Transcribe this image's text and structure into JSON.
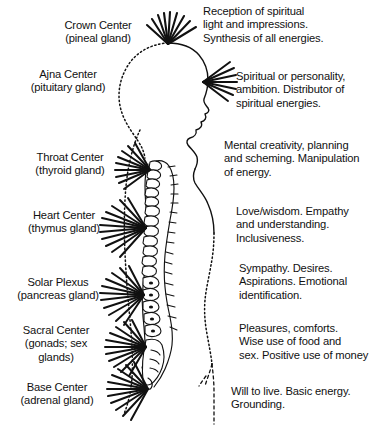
{
  "diagram": {
    "background_color": "#ffffff",
    "ink_color": "#111111"
  },
  "centers": [
    {
      "id": "crown",
      "label": "Crown Center\n(pineal gland)",
      "description": "Reception of spiritual\nlight and impressions.\nSynthesis of all energies.",
      "rays": 9
    },
    {
      "id": "ajna",
      "label": "Ajna Center\n(pituitary gland)",
      "description": "Spiritual or personality,\nambition. Distributor of\nspiritual energies.",
      "rays": 7
    },
    {
      "id": "throat",
      "label": "Throat Center\n(thyroid gland)",
      "description": "Mental creativity, planning\nand scheming. Manipulation\nof energy.",
      "rays": 9
    },
    {
      "id": "heart",
      "label": "Heart Center\n(thymus gland)",
      "description": "Love/wisdom. Empathy\nand understanding.\nInclusiveness.",
      "rays": 11
    },
    {
      "id": "solar-plexus",
      "label": "Solar Plexus\n(pancreas gland)",
      "description": "Sympathy. Desires.\nAspirations. Emotional\nidentification.",
      "rays": 11
    },
    {
      "id": "sacral",
      "label": "Sacral Center\n(gonads; sex\nglands)",
      "description": "Pleasures, comforts.\nWise use of food and\nsex. Positive use of money",
      "rays": 11
    },
    {
      "id": "base",
      "label": "Base Center\n(adrenal gland)",
      "description": "Will to live. Basic energy.\nGrounding.",
      "rays": 11
    }
  ]
}
